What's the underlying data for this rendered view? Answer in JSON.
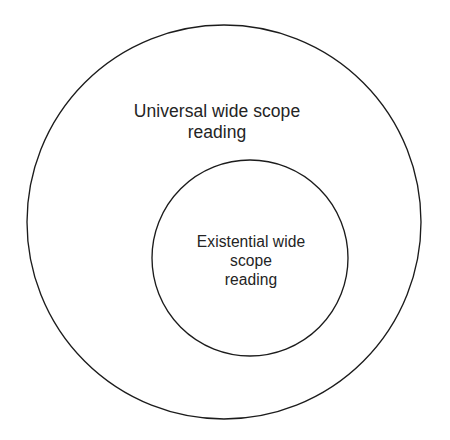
{
  "diagram": {
    "type": "euler-nested-circles",
    "background_color": "#ffffff",
    "stroke_color": "#1c1c1c",
    "text_color": "#242424",
    "outer_set": {
      "name": "universal-wide-scope-reading",
      "label_lines": [
        "Universal wide scope",
        "reading"
      ],
      "line1": "Universal wide scope",
      "line2": "reading",
      "center_x": 224,
      "center_y": 222,
      "radius": 197,
      "fill": "none"
    },
    "inner_set": {
      "name": "existential-wide-scope-reading",
      "label_lines": [
        "Existential wide",
        "scope",
        "reading"
      ],
      "line1": "Existential wide",
      "line2": "scope",
      "line3": "reading",
      "center_x": 250,
      "center_y": 258,
      "radius": 98,
      "fill": "none"
    }
  }
}
